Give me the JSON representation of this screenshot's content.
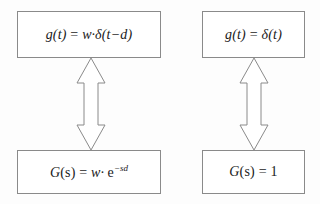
{
  "diagram": {
    "type": "block-diagram",
    "background_color": "#fdfdfd",
    "border_color": "#8a8a8a",
    "text_color": "#1a1a1a",
    "columns": [
      {
        "name": "weighted-delayed-impulse",
        "time_domain": {
          "label": "g(t) = w·δ(t−d)",
          "lhs": "g(t)",
          "equals": "=",
          "rhs_weight": "w·",
          "rhs_delta": "δ(t−d)"
        },
        "laplace_domain": {
          "label": "G(s) = w· e−sd",
          "lhs_var": "G",
          "lhs_arg": "(s)",
          "equals": "=",
          "rhs_weight": "w·",
          "rhs_base": "e",
          "rhs_exponent": "−sd"
        },
        "connector": "double-headed-vertical-arrow"
      },
      {
        "name": "unit-impulse",
        "time_domain": {
          "label": "g(t) = δ(t)",
          "lhs": "g(t)",
          "equals": "=",
          "rhs_delta": "δ(t)"
        },
        "laplace_domain": {
          "label": "G(s) = 1",
          "lhs_var": "G",
          "lhs_arg": "(s)",
          "equals": "=",
          "rhs_value": "1"
        },
        "connector": "double-headed-vertical-arrow"
      }
    ]
  }
}
